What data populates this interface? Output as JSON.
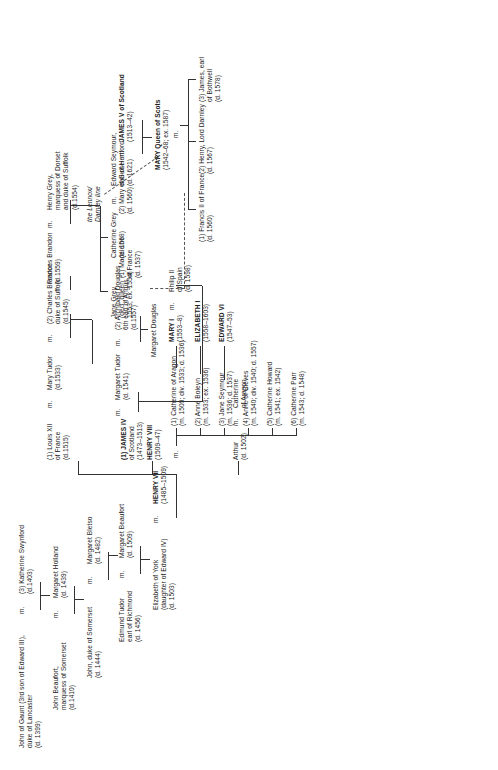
{
  "chart": {
    "type": "genealogy-tree",
    "orientation": "rotated-90-ccw"
  },
  "marriage_symbol": "m.",
  "people": {
    "john_of_gaunt": {
      "name": "John of Gaunt (3rd son of Edward III),",
      "line2": "duke of Lancaster",
      "dates": "(d. 1399)"
    },
    "katherine_swynford": {
      "name": "(3) Katherine Swynford",
      "dates": "(d.1403)"
    },
    "john_beaufort": {
      "name": "John Beaufort,",
      "line2": "marquess of Somerset",
      "dates": "(d.1410)"
    },
    "margaret_holland": {
      "name": "Margaret Holland",
      "dates": "(d. 1439)"
    },
    "john_duke_somerset": {
      "name": "John, duke of Somerset",
      "dates": "(d. 1444)"
    },
    "margaret_bletso": {
      "name": "Margaret Bletso",
      "dates": "(d. 1482)"
    },
    "edmund_tudor": {
      "name": "Edmund Tudor",
      "line2": "earl of Richmond",
      "dates": "(d. 1456)"
    },
    "margaret_beaufort": {
      "name": "Margaret Beaufort",
      "dates": "(d. 1509)"
    },
    "henry_vii": {
      "name": "HENRY VII",
      "dates": "(1485–1509)"
    },
    "elizabeth_of_york": {
      "name": "Elizabeth of York",
      "line2": "(daughter of Edward IV)",
      "dates": "(d. 1503)"
    },
    "arthur": {
      "name": "Arthur",
      "dates": "(d. 1502)"
    },
    "catherine_of_aragon_top": {
      "name": "Catherine",
      "line2": "of Aragon"
    },
    "henry_viii": {
      "name": "HENRY VIII",
      "dates": "(1509–47)"
    },
    "margaret_tudor": {
      "name": "Margaret Tudor",
      "dates": "(d. 1541)"
    },
    "james_iv": {
      "name": "(1) JAMES IV",
      "line2": "of Scotland",
      "dates": "(1473–1513)"
    },
    "archibald_douglas": {
      "name": "(2) Archibald Douglas",
      "line2": "6th earl of Angus",
      "dates": "(d.1557)"
    },
    "margaret_douglas": {
      "name": "Margaret Douglas"
    },
    "mary_tudor": {
      "name": "Mary Tudor",
      "dates": "(d.1533)"
    },
    "louis_xii": {
      "name": "(1) Louis XII",
      "line2": "of France",
      "dates": "(d.1515)"
    },
    "charles_brandon": {
      "name": "(2) Charles Brandon",
      "line2": "duke of Suffolk",
      "dates": "(d.1545)"
    },
    "frances_brandon": {
      "name": "Frances Brandon",
      "dates": "(d.1559)"
    },
    "henry_grey": {
      "name": "Henry Grey,",
      "line2": "marquess of Dorset",
      "line3": "and duke of Suffolk",
      "dates": "(d.1554)"
    },
    "jane_grey": {
      "name": "Jane Grey",
      "line2": "(decl. queen",
      "dates": "1553; ex. 1554)"
    },
    "catherine_grey": {
      "name": "Catherine Grey",
      "dates": "(d. 1568)"
    },
    "edward_seymour": {
      "name": "Edward Seymour,",
      "line2": "earl of Hertford",
      "dates": "(d. 1621)"
    },
    "james_v": {
      "name": "JAMES V of Scotland",
      "dates": "(1513–42)"
    },
    "madeleine": {
      "name": "(1) Madeleine",
      "line2": "of France",
      "dates": "(d. 1537)"
    },
    "mary_of_guise": {
      "name": "(2) Mary of Guise",
      "dates": "(d. 1560)"
    },
    "mary_queen_scots": {
      "name": "MARY Queen of Scots",
      "dates": "(1542–68; ex. 1587)"
    },
    "francis_ii": {
      "name": "(1) Francis II of France",
      "dates": "(d. 1560)"
    },
    "darnley": {
      "name": "(2) Henry, Lord Darnley",
      "dates": "(d. 1567)"
    },
    "bothwell": {
      "name": "(3) James, earl",
      "line2": "of Bothwell",
      "dates": "(d. 1578)"
    },
    "lennox_line": {
      "name": "the Lennox/",
      "line2": "Darnley line"
    },
    "mary_i": {
      "name": "MARY I",
      "dates": "(1553–8)"
    },
    "philip_ii": {
      "name": "Philip II",
      "line2": "of Spain",
      "dates": "(d. 1598)"
    },
    "elizabeth_i": {
      "name": "ELIZABETH I",
      "dates": "(1558–1603)"
    },
    "edward_vi": {
      "name": "EDWARD VI",
      "dates": "(1547–53)"
    }
  },
  "henry_viii_wives": [
    {
      "name": "(1) Catherine of Aragon",
      "dates": "(m. 1509; div. 1533; d. 1536)"
    },
    {
      "name": "(2) Anne Boleyn",
      "dates": "(m. 1533; ex. 1536)"
    },
    {
      "name": "(3) Jane Seymour",
      "dates": "(m. 1536; d. 1537)"
    },
    {
      "name": "(4) Anne of Cleves",
      "dates": "(m. 1540; div. 1540; d. 1557)"
    },
    {
      "name": "(5) Catherine Howard",
      "dates": "(m. 1541; ex. 1542)"
    },
    {
      "name": "(6) Catherine Parr",
      "dates": "(m. 1543; d. 1548)"
    }
  ],
  "colors": {
    "text": "#222222",
    "line": "#333333",
    "dashed": "#555555",
    "background": "#ffffff"
  }
}
